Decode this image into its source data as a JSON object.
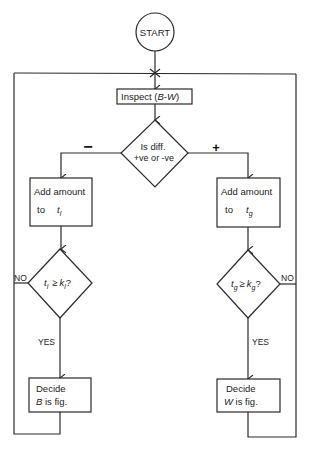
{
  "diagram": {
    "type": "flowchart",
    "start": {
      "label": "START"
    },
    "inspect": {
      "label": "Inspect (",
      "var_b": "B",
      "dash": "-",
      "var_w": "W",
      "close": ")"
    },
    "decision_sign": {
      "line1": "Is  diff.",
      "line2": "+ve or -ve"
    },
    "branches": {
      "minus": {
        "sign": "−"
      },
      "plus": {
        "sign": "+"
      }
    },
    "left": {
      "add_box": {
        "line1": "Add  amount",
        "line2_prefix": "to",
        "var": "t",
        "sub": "l"
      },
      "decision": {
        "var1": "t",
        "sub1": "l",
        "op": "≥",
        "var2": "k",
        "sub2": "l",
        "q": "?"
      },
      "no_label": "NO",
      "yes_label": "YES",
      "decide_box": {
        "line1": "Decide",
        "var": "B",
        "rest": " is  fig."
      }
    },
    "right": {
      "add_box": {
        "line1": "Add  amount",
        "line2_prefix": "to",
        "var": "t",
        "sub": "g"
      },
      "decision": {
        "var1": "t",
        "sub1": "g",
        "op": "≥",
        "var2": "k",
        "sub2": "g",
        "q": "?"
      },
      "no_label": "NO",
      "yes_label": "YES",
      "decide_box": {
        "line1": "Decide",
        "var": "W",
        "rest": " is  fig."
      }
    },
    "colors": {
      "line": "#2a2a2a",
      "background": "#ffffff",
      "text": "#222222"
    }
  }
}
